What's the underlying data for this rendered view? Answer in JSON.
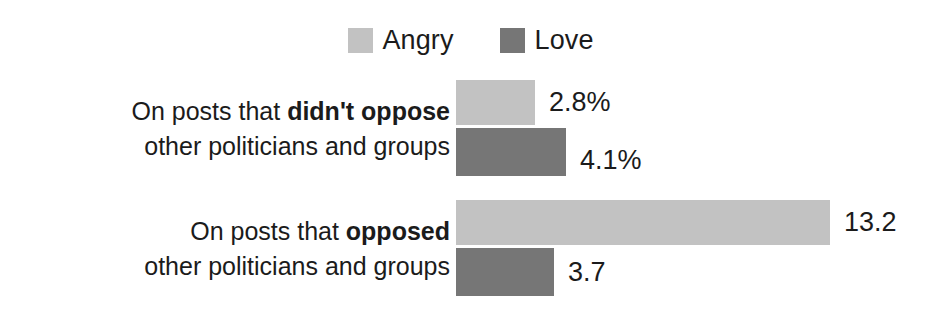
{
  "chart_data": {
    "type": "bar",
    "orientation": "horizontal",
    "title": "",
    "xlabel": "",
    "ylabel": "",
    "grid": false,
    "legend_position": "top-center",
    "xlim": [
      0,
      13.2
    ],
    "categories": [
      "On posts that didn't oppose other politicians and groups",
      "On posts that opposed other politicians and groups"
    ],
    "series": [
      {
        "name": "Angry",
        "color": "#c2c2c2",
        "values": [
          2.8,
          13.2
        ]
      },
      {
        "name": "Love",
        "color": "#767676",
        "values": [
          4.1,
          3.7
        ]
      }
    ]
  },
  "legend": {
    "items": [
      {
        "label": "Angry",
        "color": "#c2c2c2",
        "swatch_name": "legend-swatch-angry"
      },
      {
        "label": "Love",
        "color": "#767676",
        "swatch_name": "legend-swatch-love"
      }
    ]
  },
  "groups": [
    {
      "label_line1_prefix": "On posts that ",
      "label_line1_bold": "didn't oppose",
      "label_line2": "other politicians and groups",
      "bars": [
        {
          "series": "Angry",
          "value": 2.8,
          "value_label": "2.8%",
          "color": "#c2c2c2",
          "width_px": 79
        },
        {
          "series": "Love",
          "value": 4.1,
          "value_label": "4.1%",
          "color": "#767676",
          "width_px": 110
        }
      ]
    },
    {
      "label_line1_prefix": "On posts that ",
      "label_line1_bold": "opposed",
      "label_line2": "other politicians and groups",
      "bars": [
        {
          "series": "Angry",
          "value": 13.2,
          "value_label": "13.2",
          "color": "#c2c2c2",
          "width_px": 374
        },
        {
          "series": "Love",
          "value": 3.7,
          "value_label": "3.7",
          "color": "#767676",
          "width_px": 98
        }
      ]
    }
  ]
}
